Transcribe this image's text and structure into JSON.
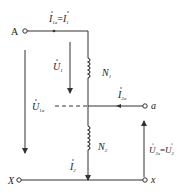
{
  "diagram": {
    "type": "autotransformer-circuit",
    "terminals": {
      "A": "A",
      "X": "X",
      "a": "a",
      "x": "x"
    },
    "windings": {
      "N1": {
        "letter": "N",
        "sub": "1"
      },
      "N2": {
        "letter": "N",
        "sub": "2"
      }
    },
    "currents": {
      "i1a": {
        "letter": "I",
        "sub": "1a"
      },
      "eq1": "=",
      "i1": {
        "letter": "I",
        "sub": "1"
      },
      "i2a": {
        "letter": "I",
        "sub": "2a"
      },
      "i2": {
        "letter": "I",
        "sub": "2"
      }
    },
    "voltages": {
      "u1": {
        "letter": "U",
        "sub": "1"
      },
      "u1a": {
        "letter": "U",
        "sub": "1a"
      },
      "u2a": {
        "letter": "U",
        "sub": "2a"
      },
      "eq2": "=",
      "u2": {
        "letter": "U",
        "sub": "2"
      }
    },
    "colors": {
      "line": "#333333",
      "text": "#222222",
      "background": "#ffffff"
    }
  }
}
